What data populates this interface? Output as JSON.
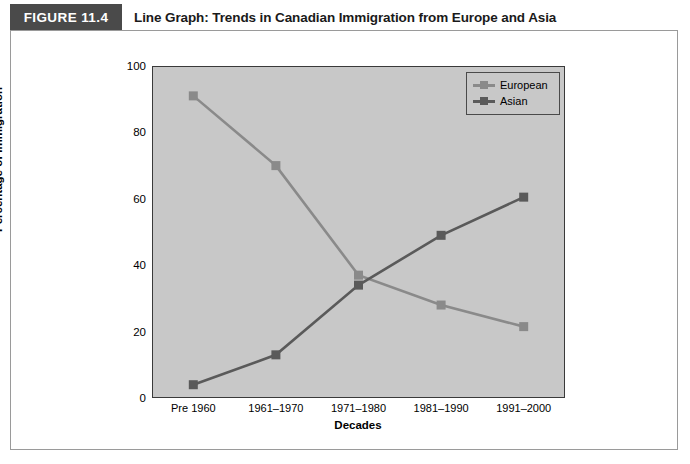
{
  "figure": {
    "number_label": "FIGURE 11.4",
    "caption": "Line Graph: Trends in Canadian Immigration from Europe and Asia",
    "header_bg": "#4a4a4a",
    "frame_border": "#9a9a9a"
  },
  "chart_data": {
    "type": "line",
    "title": "Line Graph: Trends in Canadian Immigration from Europe and Asia",
    "xlabel": "Decades",
    "ylabel": "Percentage of Immigration",
    "categories": [
      "Pre 1960",
      "1961–1970",
      "1971–1980",
      "1981–1990",
      "1991–2000"
    ],
    "ylim": [
      0,
      100
    ],
    "yticks": [
      0,
      20,
      40,
      60,
      80,
      100
    ],
    "grid": false,
    "legend_position": "top-right",
    "plot_background": "#c8c8c8",
    "series": [
      {
        "name": "European",
        "color": "#8a8a8a",
        "values": [
          91,
          70,
          37,
          28,
          21.5
        ]
      },
      {
        "name": "Asian",
        "color": "#5a5a5a",
        "values": [
          4,
          13,
          34,
          49,
          60.5
        ]
      }
    ]
  },
  "axis": {
    "y_tick_labels": [
      "100",
      "80",
      "60",
      "40",
      "20",
      "0"
    ],
    "y_title": "Percentage of Immigration",
    "x_title": "Decades",
    "x_tick_labels": [
      "Pre 1960",
      "1961–1970",
      "1971–1980",
      "1981–1990",
      "1991–2000"
    ]
  },
  "legend": {
    "entries": [
      {
        "label": "European",
        "color": "#8a8a8a"
      },
      {
        "label": "Asian",
        "color": "#5a5a5a"
      }
    ]
  }
}
